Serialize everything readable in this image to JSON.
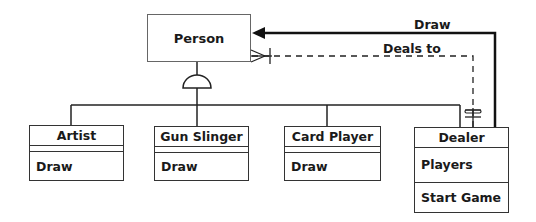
{
  "diagram": {
    "superclass": {
      "name": "Person"
    },
    "subclasses": [
      {
        "name": "Artist",
        "operations": [
          "Draw"
        ]
      },
      {
        "name": "Gun Slinger",
        "operations": [
          "Draw"
        ]
      },
      {
        "name": "Card Player",
        "operations": [
          "Draw"
        ]
      },
      {
        "name": "Dealer",
        "attributes": [
          "Players"
        ],
        "operations": [
          "Start Game"
        ]
      }
    ],
    "associations": [
      {
        "label": "Draw",
        "from": "Dealer",
        "to": "Person",
        "style": "solid-arrow"
      },
      {
        "label": "Deals to",
        "from": "Dealer",
        "to": "Person",
        "style": "dashed",
        "from_multiplicity": "one-and-only-one",
        "to_multiplicity": "many"
      }
    ]
  }
}
